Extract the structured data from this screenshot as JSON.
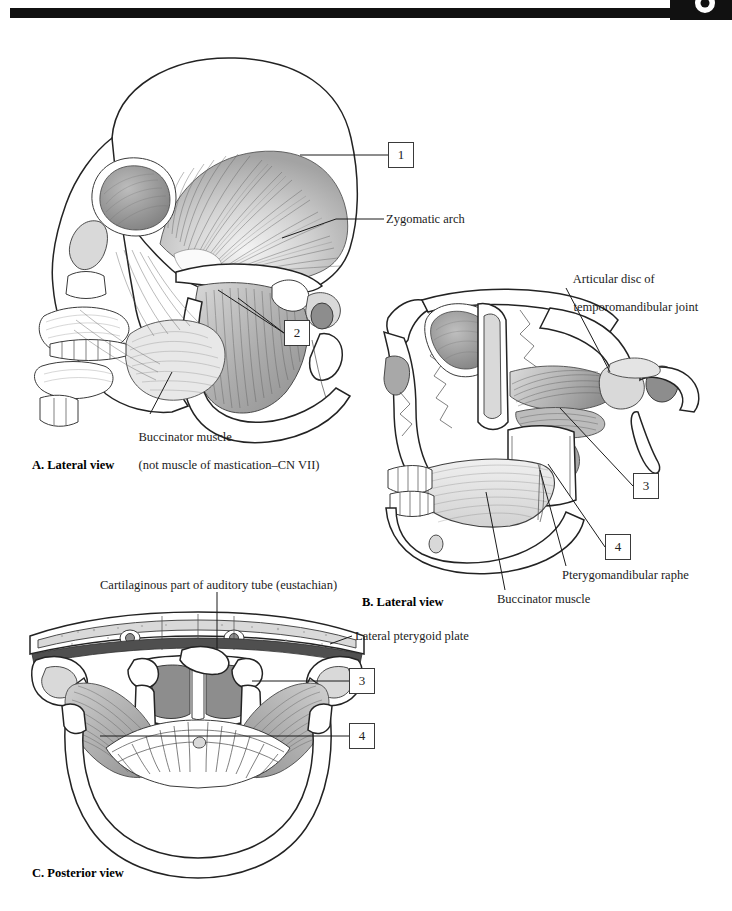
{
  "page": {
    "header_marker": "page-tab-marker"
  },
  "panels": [
    {
      "id": "A",
      "caption": "A. Lateral view",
      "labels": [
        {
          "name": "zygomatic-arch",
          "text": "Zygomatic arch"
        },
        {
          "name": "buccinator-muscle",
          "line1": "Buccinator muscle",
          "line2": "(not muscle of mastication–CN VII)"
        }
      ],
      "numbers": [
        {
          "name": "callout-1",
          "value": "1"
        },
        {
          "name": "callout-2",
          "value": "2"
        }
      ]
    },
    {
      "id": "B",
      "caption": "B. Lateral view",
      "labels": [
        {
          "name": "articular-disc",
          "line1": "Articular disc of",
          "line2": "temporomandibular joint"
        },
        {
          "name": "pterygomandibular-raphe",
          "text": "Pterygomandibular raphe"
        },
        {
          "name": "buccinator-muscle",
          "text": "Buccinator muscle"
        }
      ],
      "numbers": [
        {
          "name": "callout-3",
          "value": "3"
        },
        {
          "name": "callout-4",
          "value": "4"
        }
      ]
    },
    {
      "id": "C",
      "caption": "C. Posterior view",
      "labels": [
        {
          "name": "auditory-tube",
          "text": "Cartilaginous part of auditory tube (eustachian)"
        },
        {
          "name": "lateral-pterygoid-plate",
          "text": "Lateral pterygoid plate"
        }
      ],
      "numbers": [
        {
          "name": "callout-3",
          "value": "3"
        },
        {
          "name": "callout-4",
          "value": "4"
        }
      ]
    }
  ],
  "colors": {
    "ink": "#1b1b1b",
    "rule": "#111111",
    "box_border": "#3a3a3a",
    "paper": "#ffffff"
  }
}
